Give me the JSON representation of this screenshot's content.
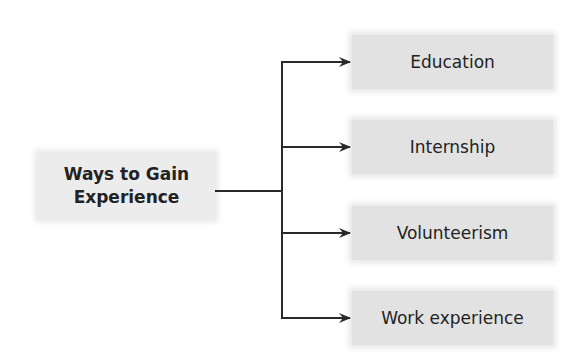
{
  "diagram": {
    "type": "tree",
    "root": {
      "label_line1": "Ways to Gain",
      "label_line2": "Experience"
    },
    "children": [
      {
        "label": "Education"
      },
      {
        "label": "Internship"
      },
      {
        "label": "Volunteerism"
      },
      {
        "label": "Work experience"
      }
    ],
    "colors": {
      "box_fill": "#e2e2e2",
      "line": "#2a2a2a",
      "text": "#222222"
    }
  }
}
